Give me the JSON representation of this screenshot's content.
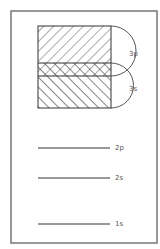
{
  "diagram": {
    "type": "energy-level / orbital band diagram",
    "bands": [
      {
        "label": "3p",
        "hatch": "forward-diagonal"
      },
      {
        "label": "3s",
        "hatch": "backward-diagonal"
      }
    ],
    "overlap_region": "cross-hatched (3p and 3s overlap)",
    "levels": [
      {
        "label": "2p"
      },
      {
        "label": "2s"
      },
      {
        "label": "1s"
      }
    ],
    "colors": {
      "line": "#333333",
      "frame": "#777777",
      "label": "#555555",
      "background": "#ffffff"
    }
  }
}
